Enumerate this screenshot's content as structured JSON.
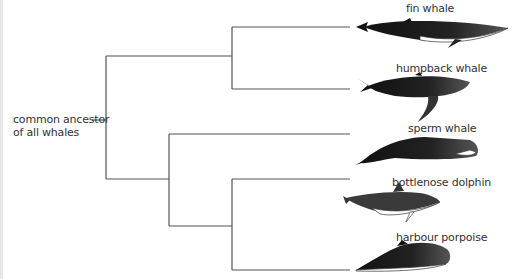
{
  "diagram": {
    "type": "phylogenetic-tree",
    "root_label_line1": "common ancestor",
    "root_label_line2": "of all whales",
    "line_color": "#555555",
    "species": [
      {
        "name": "fin whale",
        "label_x": 406,
        "label_y": 2,
        "tip_y": 27
      },
      {
        "name": "humpback whale",
        "label_x": 396,
        "label_y": 62,
        "tip_y": 89
      },
      {
        "name": "sperm whale",
        "label_x": 408,
        "label_y": 122,
        "tip_y": 134
      },
      {
        "name": "bottlenose dolphin",
        "label_x": 392,
        "label_y": 175,
        "tip_y": 179
      },
      {
        "name": "harbour porpoise",
        "label_x": 396,
        "label_y": 230,
        "tip_y": 270
      }
    ]
  }
}
